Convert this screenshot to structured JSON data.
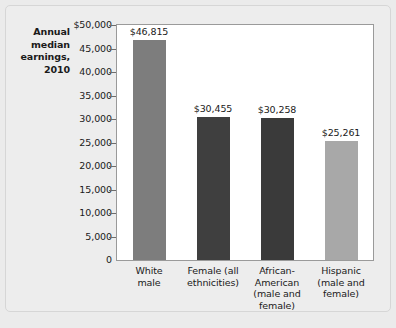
{
  "chart_data": {
    "type": "bar",
    "title": "",
    "subtitle": "",
    "ylabel": "Annual median earnings, 2010",
    "xlabel": "",
    "ylim": [
      0,
      50000
    ],
    "grid": false,
    "legend": "none",
    "categories": [
      "White male",
      "Female (all ethnicities)",
      "African-American (male and female)",
      "Hispanic (male and female)"
    ],
    "values": [
      46815,
      30455,
      30258,
      25261
    ],
    "value_labels": [
      "$46,815",
      "$30,455",
      "$30,258",
      "$25,261"
    ],
    "bar_colors": [
      "#7d7d7d",
      "#3f3f3f",
      "#3a3a3a",
      "#a8a8a8"
    ],
    "y_ticks": [
      50000,
      45000,
      40000,
      35000,
      30000,
      25000,
      20000,
      15000,
      10000,
      5000,
      0
    ],
    "y_tick_labels": [
      "$50,000",
      "45,000",
      "40,000",
      "35,000",
      "30,000",
      "25,000",
      "20,000",
      "15,000",
      "10,000",
      "5,000",
      "0"
    ]
  },
  "axis_title": {
    "lines": [
      "Annual",
      "median",
      "earnings,",
      "2010"
    ]
  },
  "category_label_lines": [
    [
      "White",
      "male"
    ],
    [
      "Female (all",
      "ethnicities)"
    ],
    [
      "African-",
      "American",
      "(male and",
      "female)"
    ],
    [
      "Hispanic",
      "(male and",
      "female)"
    ]
  ],
  "colors": {
    "page_background": "#ebebeb",
    "card_background": "#ededed",
    "card_border": "#d6d6d6",
    "plot_background": "#ffffff",
    "plot_border": "#9a9a9a",
    "text": "#1a1a1a",
    "tick_mark": "#6d6d6d"
  }
}
